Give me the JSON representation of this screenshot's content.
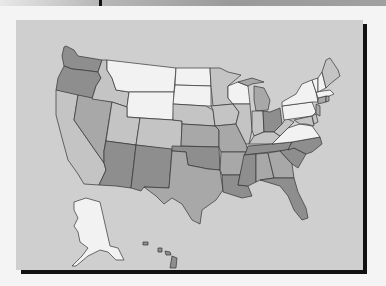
{
  "map": {
    "title": "",
    "type": "choropleth",
    "region": "United States",
    "colors": {
      "background": "#cfcfcf",
      "level_0": "#f2f2f2",
      "level_1": "#c4c4c4",
      "level_2": "#a8a8a8",
      "level_3": "#8e8e8e",
      "border": "#333333",
      "frame_shadow": "#111111"
    },
    "legend": [],
    "states_shading": {
      "WA": 3,
      "OR": 3,
      "CA": 1,
      "NV": 2,
      "ID": 1,
      "MT": 0,
      "WY": 0,
      "UT": 1,
      "CO": 1,
      "AZ": 3,
      "NM": 3,
      "ND": 0,
      "SD": 0,
      "NE": 1,
      "KS": 2,
      "OK": 3,
      "TX": 2,
      "MN": 1,
      "IA": 1,
      "MO": 2,
      "AR": 2,
      "LA": 3,
      "WI": 0,
      "IL": 1,
      "MI": 2,
      "IN": 1,
      "OH": 3,
      "KY": 1,
      "TN": 3,
      "MS": 3,
      "AL": 2,
      "GA": 2,
      "FL": 3,
      "SC": 3,
      "NC": 3,
      "VA": 0,
      "WV": 1,
      "PA": 0,
      "NY": 0,
      "VT": 0,
      "NH": 0,
      "ME": 1,
      "MA": 0,
      "CT": 2,
      "RI": 2,
      "NJ": 2,
      "DE": 1,
      "MD": 1,
      "AK": 0,
      "HI": 3
    }
  }
}
